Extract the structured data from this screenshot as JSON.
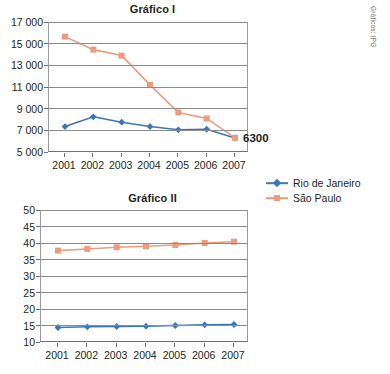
{
  "credit": "Gráficos: IPG",
  "legend": {
    "items": [
      {
        "label": "Rio de Janeiro",
        "color": "#3c76b4",
        "marker": "diamond"
      },
      {
        "label": "São Paulo",
        "color": "#ed9b7f",
        "marker": "square"
      }
    ]
  },
  "chart_data": [
    {
      "type": "line",
      "title": "Gráfico I",
      "xlabel": "",
      "ylabel": "",
      "x": [
        "2001",
        "2002",
        "2003",
        "2004",
        "2005",
        "2006",
        "2007"
      ],
      "categories": [
        "2001",
        "2002",
        "2003",
        "2004",
        "2005",
        "2006",
        "2007"
      ],
      "ylim": [
        5000,
        17000
      ],
      "yticks": [
        5000,
        7000,
        9000,
        11000,
        13000,
        15000,
        17000
      ],
      "ytick_labels": [
        "5 000",
        "7 000",
        "9 000",
        "11 000",
        "13 000",
        "15 000",
        "17 000"
      ],
      "grid": true,
      "legend_position": "right-below",
      "series": [
        {
          "name": "Rio de Janeiro",
          "color": "#3c76b4",
          "marker": "diamond",
          "values": [
            7350,
            8250,
            7750,
            7350,
            7050,
            7100,
            6300
          ]
        },
        {
          "name": "São Paulo",
          "color": "#ed9b7f",
          "marker": "square",
          "values": [
            15650,
            14450,
            13900,
            11200,
            8650,
            8100,
            6300
          ]
        }
      ],
      "annotations": [
        {
          "text": "6300",
          "x": "2007",
          "y": 6300
        }
      ]
    },
    {
      "type": "line",
      "title": "Gráfico II",
      "xlabel": "",
      "ylabel": "",
      "x": [
        "2001",
        "2002",
        "2003",
        "2004",
        "2005",
        "2006",
        "2007"
      ],
      "categories": [
        "2001",
        "2002",
        "2003",
        "2004",
        "2005",
        "2006",
        "2007"
      ],
      "ylim": [
        10,
        50
      ],
      "yticks": [
        10,
        15,
        20,
        25,
        30,
        35,
        40,
        45,
        50
      ],
      "ytick_labels": [
        "10",
        "15",
        "20",
        "25",
        "30",
        "35",
        "40",
        "45",
        "50"
      ],
      "grid": true,
      "legend_position": "right-above",
      "series": [
        {
          "name": "Rio de Janeiro",
          "color": "#3c76b4",
          "marker": "diamond",
          "values": [
            14.4,
            14.6,
            14.7,
            14.8,
            15.0,
            15.2,
            15.3
          ]
        },
        {
          "name": "São Paulo",
          "color": "#ed9b7f",
          "marker": "square",
          "values": [
            37.7,
            38.2,
            38.7,
            39.0,
            39.4,
            40.0,
            40.4
          ]
        }
      ],
      "annotations": []
    }
  ]
}
